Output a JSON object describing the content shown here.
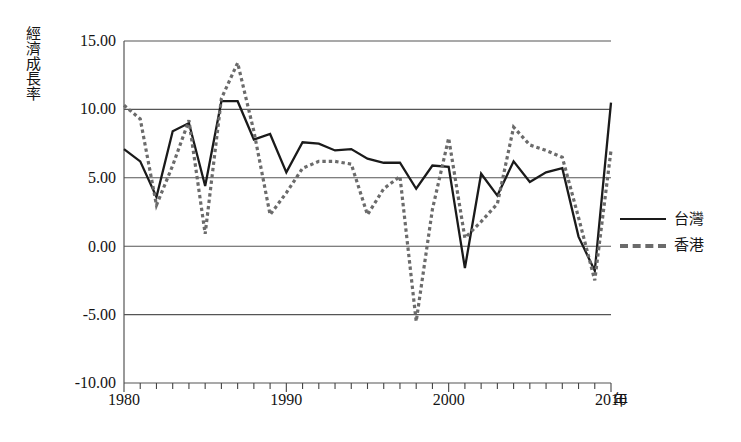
{
  "axis": {
    "y_title": "經濟成長率",
    "x_unit": "年",
    "y_ticks": [
      "15.00",
      "10.00",
      "5.00",
      "0.00",
      "-5.00",
      "-10.00"
    ],
    "x_ticks": [
      "1980",
      "1990",
      "2000",
      "2010"
    ]
  },
  "legend": {
    "items": [
      {
        "label": "台灣",
        "style": "solid",
        "color": "#1a1a1a"
      },
      {
        "label": "香港",
        "style": "dashed",
        "color": "#6b6b6b"
      }
    ]
  },
  "caption": {
    "text": ""
  },
  "chart_data": {
    "type": "line",
    "title": "",
    "xlabel": "年",
    "ylabel": "經濟成長率",
    "xlim": [
      1980,
      2010
    ],
    "ylim": [
      -10.0,
      15.0
    ],
    "yticks": [
      -10.0,
      -5.0,
      0.0,
      5.0,
      10.0,
      15.0
    ],
    "xticks": [
      1980,
      1990,
      2000,
      2010
    ],
    "grid": "horizontal",
    "legend_position": "right",
    "x": [
      1980,
      1981,
      1982,
      1983,
      1984,
      1985,
      1986,
      1987,
      1988,
      1989,
      1990,
      1991,
      1992,
      1993,
      1994,
      1995,
      1996,
      1997,
      1998,
      1999,
      2000,
      2001,
      2002,
      2003,
      2004,
      2005,
      2006,
      2007,
      2008,
      2009,
      2010
    ],
    "series": [
      {
        "name": "台灣",
        "style": "solid",
        "color": "#1a1a1a",
        "values": [
          7.1,
          6.2,
          3.6,
          8.4,
          9.0,
          4.4,
          10.6,
          10.6,
          7.8,
          8.2,
          5.4,
          7.6,
          7.5,
          7.0,
          7.1,
          6.4,
          6.1,
          6.1,
          4.2,
          5.9,
          5.8,
          -1.6,
          5.3,
          3.7,
          6.2,
          4.7,
          5.4,
          5.7,
          0.7,
          -1.8,
          10.5
        ]
      },
      {
        "name": "香港",
        "style": "dashed",
        "color": "#6b6b6b",
        "values": [
          10.3,
          9.3,
          3.0,
          5.9,
          9.2,
          0.9,
          10.8,
          13.4,
          8.4,
          2.3,
          3.9,
          5.7,
          6.2,
          6.2,
          6.0,
          2.3,
          4.2,
          5.1,
          -5.5,
          2.7,
          7.9,
          0.6,
          1.8,
          3.1,
          8.7,
          7.4,
          7.0,
          6.5,
          2.1,
          -2.5,
          7.0
        ]
      }
    ]
  },
  "geometry": {
    "plot_left": 124,
    "plot_right": 611,
    "plot_top": 41,
    "plot_bottom": 383
  }
}
